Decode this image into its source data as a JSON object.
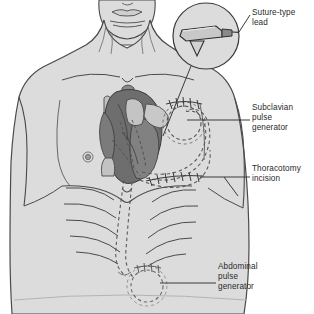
{
  "figure": {
    "background_color": "#ffffff"
  },
  "colors": {
    "skin_fill": "#dcdcdc",
    "skin_outline": "#4a4a4a",
    "heart_dark": "#6e6e6e",
    "heart_mid": "#8a8a8a",
    "vessel_light": "#c2c2c2",
    "lead_dashed": "#5a5a5a",
    "leader_line": "#3a3a3a",
    "label_text": "#2a2a2a",
    "inset_fill": "#d6d6d6"
  },
  "callouts": [
    {
      "id": "suture-type-lead",
      "lines": [
        "Suture-type",
        "lead"
      ],
      "line1": "Suture-type",
      "line2": "lead",
      "target": "inset-detail-circle"
    },
    {
      "id": "subclavian-pulse-generator",
      "lines": [
        "Subclavian",
        "pulse",
        "generator"
      ],
      "line1": "Subclavian",
      "line2": "pulse",
      "line3": "generator",
      "target": "subclavian-generator-pocket"
    },
    {
      "id": "thoracotomy-incision",
      "lines": [
        "Thoracotomy",
        "incision"
      ],
      "line1": "Thoracotomy",
      "line2": "incision",
      "target": "thoracotomy-incision-suture-line"
    },
    {
      "id": "abdominal-pulse-generator",
      "lines": [
        "Abdominal",
        "pulse",
        "generator"
      ],
      "line1": "Abdominal",
      "line2": "pulse",
      "line3": "generator",
      "target": "abdominal-generator-pocket"
    }
  ],
  "anatomy": {
    "head_and_neck": "chin, lips and neck at top of figure",
    "torso": "shoulders, chest, rib cage and upper abdomen",
    "heart": "heart shown in cutaway with great vessels",
    "nipple_marker": "small concentric circle on left chest",
    "ribs": "curved rib arcs with costal margin"
  },
  "devices": {
    "inset": {
      "name": "suture-type epicardial lead detail",
      "shape": "magnified circle inset showing flat lead body with V-shaped barb and connector tip"
    },
    "subclavian_pocket": {
      "name": "subclavian pulse generator",
      "shape": "dashed circular generator outline beneath skin with suture marks above"
    },
    "abdominal_pocket": {
      "name": "abdominal pulse generator",
      "shape": "dashed circular generator outline in upper abdomen with suture marks above"
    },
    "leads": "dashed lead wires tunneled from heart to both generator pockets"
  }
}
